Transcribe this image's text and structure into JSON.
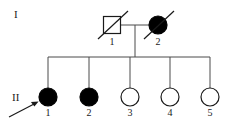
{
  "figure": {
    "kind": "pedigree-chart",
    "width": 235,
    "height": 119,
    "background_color": "#ffffff",
    "line_color": "#4a4a4a",
    "symbol_stroke_color": "#1a1a1a",
    "affected_fill_color": "#000000",
    "unaffected_fill_color": "#ffffff",
    "text_color": "#1a1a1a"
  },
  "generations": [
    {
      "id": "I",
      "label": "I"
    },
    {
      "id": "II",
      "label": "II"
    }
  ],
  "individuals": [
    {
      "key": "I-1",
      "generation": "I",
      "number": "1",
      "sex": "male",
      "shape": "square",
      "affected": false,
      "deceased": true,
      "proband": false,
      "cx": 112,
      "cy": 25,
      "size": 17
    },
    {
      "key": "I-2",
      "generation": "I",
      "number": "2",
      "sex": "female",
      "shape": "circle",
      "affected": true,
      "deceased": true,
      "proband": false,
      "cx": 158,
      "cy": 25,
      "size": 9
    },
    {
      "key": "II-1",
      "generation": "II",
      "number": "1",
      "sex": "female",
      "shape": "circle",
      "affected": true,
      "deceased": false,
      "proband": true,
      "cx": 48,
      "cy": 97,
      "size": 9
    },
    {
      "key": "II-2",
      "generation": "II",
      "number": "2",
      "sex": "female",
      "shape": "circle",
      "affected": true,
      "deceased": false,
      "proband": false,
      "cx": 89,
      "cy": 97,
      "size": 9
    },
    {
      "key": "II-3",
      "generation": "II",
      "number": "3",
      "sex": "female",
      "shape": "circle",
      "affected": false,
      "deceased": false,
      "proband": false,
      "cx": 130,
      "cy": 97,
      "size": 9
    },
    {
      "key": "II-4",
      "generation": "II",
      "number": "4",
      "sex": "female",
      "shape": "circle",
      "affected": false,
      "deceased": false,
      "proband": false,
      "cx": 170,
      "cy": 97,
      "size": 9
    },
    {
      "key": "II-5",
      "generation": "II",
      "number": "5",
      "sex": "female",
      "shape": "circle",
      "affected": false,
      "deceased": false,
      "proband": false,
      "cx": 210,
      "cy": 97,
      "size": 9
    }
  ],
  "labels": {
    "generation_I": "I",
    "generation_II": "II",
    "id_I_1": "1",
    "id_I_2": "2",
    "id_II_1": "1",
    "id_II_2": "2",
    "id_II_3": "3",
    "id_II_4": "4",
    "id_II_5": "5"
  },
  "label_positions": {
    "generation_I": {
      "x": 14,
      "y": 18
    },
    "generation_II": {
      "x": 12,
      "y": 101
    },
    "id_I_1": {
      "x": 112,
      "y": 45
    },
    "id_I_2": {
      "x": 158,
      "y": 45
    },
    "id_II_1": {
      "x": 48,
      "y": 116
    },
    "id_II_2": {
      "x": 89,
      "y": 116
    },
    "id_II_3": {
      "x": 130,
      "y": 116
    },
    "id_II_4": {
      "x": 170,
      "y": 116
    },
    "id_II_5": {
      "x": 210,
      "y": 116
    }
  },
  "connections": {
    "mating_line": {
      "x1": 121,
      "y1": 25,
      "x2": 149,
      "y2": 25
    },
    "descent_line": {
      "x1": 135,
      "y1": 25,
      "x2": 135,
      "y2": 57
    },
    "sibship_line": {
      "x1": 48,
      "y1": 57,
      "x2": 210,
      "y2": 57
    },
    "drop_lines": [
      {
        "x": 48,
        "y1": 57,
        "y2": 88
      },
      {
        "x": 89,
        "y1": 57,
        "y2": 88
      },
      {
        "x": 130,
        "y1": 57,
        "y2": 88
      },
      {
        "x": 170,
        "y1": 57,
        "y2": 88
      },
      {
        "x": 210,
        "y1": 57,
        "y2": 88
      }
    ]
  },
  "proband_arrow": {
    "target": "II-1",
    "x1": 9,
    "y1": 117,
    "x2": 38,
    "y2": 102
  },
  "deceased_slashes": [
    {
      "target": "I-1",
      "x1": 98,
      "y1": 39,
      "x2": 128,
      "y2": 11
    },
    {
      "target": "I-2",
      "x1": 144,
      "y1": 39,
      "x2": 174,
      "y2": 11
    }
  ]
}
